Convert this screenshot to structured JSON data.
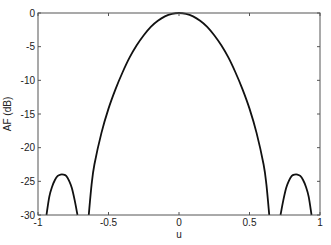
{
  "chart_data": {
    "type": "line",
    "title": "",
    "xlabel": "u",
    "ylabel": "AF (dB)",
    "xlim": [
      -1,
      1
    ],
    "ylim": [
      -30,
      0
    ],
    "grid": false,
    "xticks": [
      -1,
      -0.5,
      0,
      0.5,
      1
    ],
    "xtick_labels": [
      "-1",
      "-0.5",
      "0",
      "0.5",
      "1"
    ],
    "yticks": [
      0,
      -5,
      -10,
      -15,
      -20,
      -25,
      -30
    ],
    "ytick_labels": [
      "0",
      "-5",
      "-10",
      "-15",
      "-20",
      "-25",
      "-30"
    ],
    "series": [
      {
        "name": "array factor",
        "color": "#111111",
        "segments": [
          {
            "x": [
              -0.94,
              -0.92,
              -0.9,
              -0.88,
              -0.86,
              -0.84,
              -0.82,
              -0.8,
              -0.78,
              -0.76,
              -0.74,
              -0.72
            ],
            "y": [
              -30,
              -27.3,
              -25.8,
              -24.8,
              -24.2,
              -24.0,
              -24.0,
              -24.2,
              -24.9,
              -26.0,
              -27.8,
              -30
            ]
          },
          {
            "x": [
              -0.64,
              -0.62,
              -0.6,
              -0.55,
              -0.5,
              -0.45,
              -0.4,
              -0.35,
              -0.3,
              -0.25,
              -0.2,
              -0.15,
              -0.1,
              -0.05,
              0,
              0.05,
              0.1,
              0.15,
              0.2,
              0.25,
              0.3,
              0.35,
              0.4,
              0.45,
              0.5,
              0.55,
              0.6,
              0.62,
              0.64
            ],
            "y": [
              -30,
              -25.5,
              -22.5,
              -17.8,
              -14.2,
              -11.3,
              -8.8,
              -6.6,
              -4.8,
              -3.3,
              -2.05,
              -1.15,
              -0.5,
              -0.12,
              0,
              -0.12,
              -0.5,
              -1.15,
              -2.05,
              -3.3,
              -4.8,
              -6.6,
              -8.8,
              -11.3,
              -14.2,
              -17.8,
              -22.5,
              -25.5,
              -30
            ]
          },
          {
            "x": [
              0.72,
              0.74,
              0.76,
              0.78,
              0.8,
              0.82,
              0.84,
              0.86,
              0.88,
              0.9,
              0.92,
              0.94
            ],
            "y": [
              -30,
              -27.8,
              -26.0,
              -24.9,
              -24.2,
              -24.0,
              -24.0,
              -24.2,
              -24.8,
              -25.8,
              -27.3,
              -30
            ]
          }
        ]
      }
    ]
  }
}
